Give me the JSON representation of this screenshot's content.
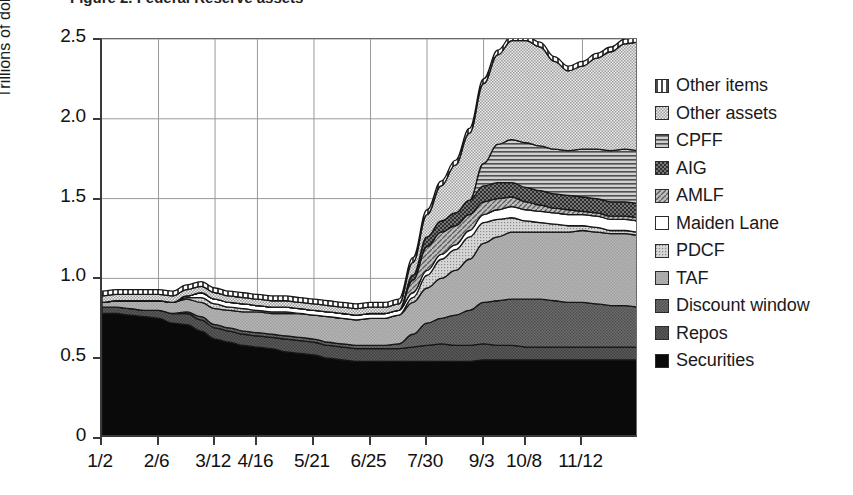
{
  "figure": {
    "title_partial": "Figure 2. Federal Reserve assets",
    "background": "#ffffff"
  },
  "axes": {
    "y": {
      "label": "Trillions of dollars",
      "ticks": [
        "0",
        "0.5",
        "1.0",
        "1.5",
        "2.0",
        "2.5"
      ],
      "tick_values": [
        0,
        0.5,
        1.0,
        1.5,
        2.0,
        2.5
      ],
      "min": 0,
      "max": 2.5
    },
    "x": {
      "label": "",
      "ticks": [
        "1/2",
        "2/6",
        "3/12",
        "4/16",
        "5/21",
        "6/25",
        "7/30",
        "9/3",
        "10/8",
        "11/12"
      ]
    }
  },
  "legend": {
    "position": "right",
    "items": [
      {
        "label": "Other items",
        "pattern": "vertical-stripes",
        "color": "#e8e8e8"
      },
      {
        "label": "Other assets",
        "pattern": "fine-checker",
        "color": "#cfcfcf"
      },
      {
        "label": "CPFF",
        "pattern": "horizontal-lines",
        "color": "#a8a8a8"
      },
      {
        "label": "AIG",
        "pattern": "dark-checker",
        "color": "#3c3c3c"
      },
      {
        "label": "AMLF",
        "pattern": "diagonal-hatch",
        "color": "#8f8f8f"
      },
      {
        "label": "Maiden Lane",
        "pattern": "solid-white",
        "color": "#ffffff"
      },
      {
        "label": "PDCF",
        "pattern": "light-dots",
        "color": "#bdbdbd"
      },
      {
        "label": "TAF",
        "pattern": "mid-checker",
        "color": "#969696"
      },
      {
        "label": "Discount window",
        "pattern": "dark-dots",
        "color": "#5a5a5a"
      },
      {
        "label": "Repos",
        "pattern": "darker-checker",
        "color": "#4a4a4a"
      },
      {
        "label": "Securities",
        "pattern": "solid-black",
        "color": "#0a0a0a"
      }
    ]
  },
  "chart_data": {
    "type": "area",
    "stacked": true,
    "title": "Federal Reserve assets",
    "xlabel": "",
    "ylabel": "Trillions of dollars",
    "ylim": [
      0,
      2.5
    ],
    "grid": true,
    "legend_position": "right",
    "x": [
      "1/2",
      "1/16",
      "1/30",
      "2/6",
      "2/20",
      "3/5",
      "3/12",
      "3/26",
      "4/9",
      "4/16",
      "4/30",
      "5/14",
      "5/21",
      "6/4",
      "6/18",
      "6/25",
      "7/9",
      "7/23",
      "7/30",
      "8/13",
      "8/27",
      "9/3",
      "9/10",
      "9/17",
      "9/24",
      "10/1",
      "10/8",
      "10/15",
      "10/22",
      "10/29",
      "11/5",
      "11/12",
      "11/19",
      "11/26",
      "12/3",
      "12/10",
      "12/17",
      "12/24",
      "12/31"
    ],
    "series": [
      {
        "name": "Securities",
        "values": [
          0.78,
          0.78,
          0.77,
          0.76,
          0.75,
          0.72,
          0.71,
          0.67,
          0.62,
          0.6,
          0.58,
          0.57,
          0.56,
          0.54,
          0.53,
          0.52,
          0.5,
          0.49,
          0.48,
          0.48,
          0.48,
          0.48,
          0.48,
          0.48,
          0.48,
          0.48,
          0.48,
          0.49,
          0.49,
          0.49,
          0.49,
          0.49,
          0.49,
          0.49,
          0.49,
          0.49,
          0.49,
          0.49,
          0.49
        ]
      },
      {
        "name": "Repos",
        "values": [
          0.04,
          0.04,
          0.04,
          0.04,
          0.05,
          0.06,
          0.07,
          0.07,
          0.07,
          0.07,
          0.07,
          0.07,
          0.07,
          0.08,
          0.08,
          0.08,
          0.08,
          0.08,
          0.08,
          0.08,
          0.08,
          0.08,
          0.09,
          0.1,
          0.11,
          0.1,
          0.1,
          0.1,
          0.09,
          0.09,
          0.08,
          0.08,
          0.08,
          0.08,
          0.08,
          0.08,
          0.08,
          0.08,
          0.08
        ]
      },
      {
        "name": "Discount window",
        "values": [
          0.0,
          0.0,
          0.0,
          0.0,
          0.0,
          0.0,
          0.01,
          0.02,
          0.02,
          0.02,
          0.02,
          0.02,
          0.02,
          0.02,
          0.02,
          0.02,
          0.02,
          0.02,
          0.02,
          0.02,
          0.02,
          0.03,
          0.08,
          0.14,
          0.16,
          0.19,
          0.22,
          0.26,
          0.28,
          0.29,
          0.3,
          0.3,
          0.29,
          0.28,
          0.28,
          0.27,
          0.26,
          0.26,
          0.25
        ]
      },
      {
        "name": "TAF",
        "values": [
          0.03,
          0.04,
          0.05,
          0.06,
          0.06,
          0.07,
          0.08,
          0.09,
          0.1,
          0.11,
          0.12,
          0.13,
          0.13,
          0.14,
          0.15,
          0.15,
          0.16,
          0.16,
          0.16,
          0.17,
          0.17,
          0.18,
          0.2,
          0.22,
          0.25,
          0.28,
          0.32,
          0.37,
          0.4,
          0.42,
          0.42,
          0.42,
          0.43,
          0.44,
          0.45,
          0.45,
          0.45,
          0.45,
          0.45
        ]
      },
      {
        "name": "PDCF",
        "values": [
          0.0,
          0.0,
          0.0,
          0.0,
          0.0,
          0.0,
          0.01,
          0.03,
          0.03,
          0.02,
          0.02,
          0.01,
          0.01,
          0.01,
          0.0,
          0.0,
          0.0,
          0.0,
          0.0,
          0.0,
          0.0,
          0.0,
          0.03,
          0.08,
          0.12,
          0.13,
          0.14,
          0.13,
          0.11,
          0.09,
          0.07,
          0.06,
          0.05,
          0.04,
          0.03,
          0.03,
          0.02,
          0.02,
          0.02
        ]
      },
      {
        "name": "Maiden Lane",
        "values": [
          0.0,
          0.0,
          0.0,
          0.0,
          0.0,
          0.0,
          0.01,
          0.03,
          0.03,
          0.03,
          0.03,
          0.03,
          0.03,
          0.03,
          0.03,
          0.03,
          0.03,
          0.03,
          0.03,
          0.03,
          0.03,
          0.03,
          0.03,
          0.03,
          0.03,
          0.03,
          0.04,
          0.05,
          0.06,
          0.07,
          0.07,
          0.07,
          0.07,
          0.07,
          0.07,
          0.07,
          0.07,
          0.07,
          0.07
        ]
      },
      {
        "name": "AMLF",
        "values": [
          0.0,
          0.0,
          0.0,
          0.0,
          0.0,
          0.0,
          0.0,
          0.0,
          0.0,
          0.0,
          0.0,
          0.0,
          0.0,
          0.0,
          0.0,
          0.0,
          0.0,
          0.0,
          0.0,
          0.0,
          0.0,
          0.0,
          0.08,
          0.15,
          0.14,
          0.12,
          0.1,
          0.08,
          0.07,
          0.06,
          0.05,
          0.04,
          0.03,
          0.03,
          0.02,
          0.02,
          0.02,
          0.02,
          0.02
        ]
      },
      {
        "name": "AIG",
        "values": [
          0.0,
          0.0,
          0.0,
          0.0,
          0.0,
          0.0,
          0.0,
          0.0,
          0.0,
          0.0,
          0.0,
          0.0,
          0.0,
          0.0,
          0.0,
          0.0,
          0.0,
          0.0,
          0.0,
          0.0,
          0.0,
          0.0,
          0.03,
          0.06,
          0.07,
          0.08,
          0.09,
          0.1,
          0.1,
          0.09,
          0.09,
          0.09,
          0.09,
          0.09,
          0.09,
          0.09,
          0.09,
          0.09,
          0.09
        ]
      },
      {
        "name": "CPFF",
        "values": [
          0.0,
          0.0,
          0.0,
          0.0,
          0.0,
          0.0,
          0.0,
          0.0,
          0.0,
          0.0,
          0.0,
          0.0,
          0.0,
          0.0,
          0.0,
          0.0,
          0.0,
          0.0,
          0.0,
          0.0,
          0.0,
          0.0,
          0.0,
          0.0,
          0.0,
          0.0,
          0.0,
          0.14,
          0.24,
          0.27,
          0.28,
          0.28,
          0.28,
          0.28,
          0.3,
          0.31,
          0.32,
          0.33,
          0.33
        ]
      },
      {
        "name": "Other assets",
        "values": [
          0.04,
          0.04,
          0.04,
          0.04,
          0.04,
          0.04,
          0.04,
          0.04,
          0.04,
          0.04,
          0.04,
          0.04,
          0.04,
          0.04,
          0.04,
          0.04,
          0.04,
          0.04,
          0.04,
          0.04,
          0.04,
          0.04,
          0.08,
          0.14,
          0.22,
          0.3,
          0.42,
          0.5,
          0.56,
          0.62,
          0.64,
          0.62,
          0.55,
          0.5,
          0.52,
          0.57,
          0.62,
          0.66,
          0.68
        ]
      },
      {
        "name": "Other items",
        "values": [
          0.03,
          0.03,
          0.03,
          0.03,
          0.03,
          0.03,
          0.03,
          0.03,
          0.03,
          0.03,
          0.03,
          0.03,
          0.03,
          0.03,
          0.03,
          0.03,
          0.03,
          0.03,
          0.03,
          0.03,
          0.03,
          0.03,
          0.03,
          0.03,
          0.03,
          0.03,
          0.03,
          0.03,
          0.03,
          0.03,
          0.03,
          0.03,
          0.03,
          0.03,
          0.03,
          0.03,
          0.03,
          0.03,
          0.03
        ]
      }
    ]
  }
}
